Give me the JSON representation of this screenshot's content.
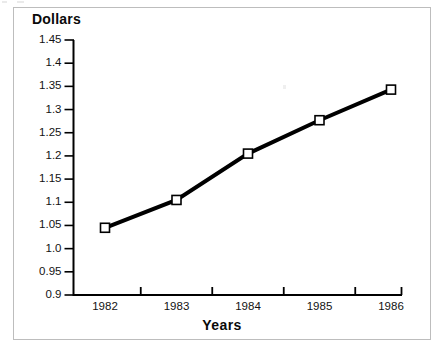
{
  "chart_data": {
    "type": "line",
    "title": "",
    "subtitle": "",
    "xlabel": "Years",
    "ylabel": "Dollars",
    "categories": [
      "1982",
      "1983",
      "1984",
      "1985",
      "1986"
    ],
    "x": [
      1982,
      1983,
      1984,
      1985,
      1986
    ],
    "values": [
      1.045,
      1.105,
      1.205,
      1.277,
      1.343
    ],
    "series": [
      {
        "name": "Dollars",
        "values": [
          1.045,
          1.105,
          1.205,
          1.277,
          1.343
        ],
        "line_color": "#000000",
        "line_width": 4,
        "marker": "open-square",
        "marker_face_color": "#ffffff",
        "marker_edge_color": "#000000"
      }
    ],
    "ylim": [
      0.9,
      1.45
    ],
    "yticks": [
      "0.9",
      "0.95",
      "1.0",
      "1.05",
      "1.1",
      "1.15",
      "1.2",
      "1.25",
      "1.3",
      "1.35",
      "1.4",
      "1.45"
    ],
    "ytick_values": [
      0.9,
      0.95,
      1.0,
      1.05,
      1.1,
      1.15,
      1.2,
      1.25,
      1.3,
      1.35,
      1.4,
      1.45
    ],
    "xticks": [
      "1982",
      "1983",
      "1984",
      "1985",
      "1986"
    ],
    "grid": false,
    "legend": null,
    "legend_position": "none",
    "annotations": []
  },
  "axes": {
    "y_title": "Dollars",
    "x_title": "Years",
    "y_tick_labels": [
      "1.45",
      "1.4",
      "1.35",
      "1.3",
      "1.25",
      "1.2",
      "1.15",
      "1.1",
      "1.05",
      "1.0",
      "0.95",
      "0.9"
    ],
    "x_tick_labels": [
      "1982",
      "1983",
      "1984",
      "1985",
      "1986"
    ]
  },
  "style": {
    "axis_color": "#000000",
    "line_color": "#000000",
    "marker_fill": "#ffffff",
    "frame_color": "#bdbdbd",
    "background": "#ffffff",
    "text_color": "#121212"
  }
}
